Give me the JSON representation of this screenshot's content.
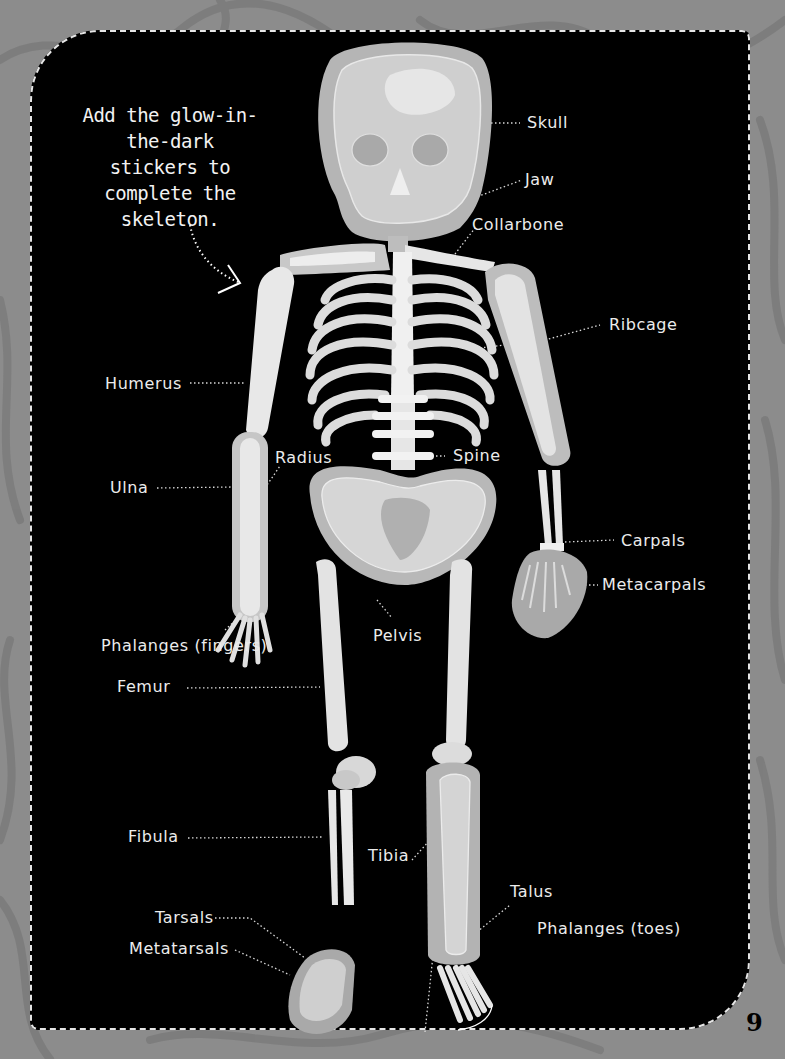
{
  "instruction": "Add the glow-in-the-dark stickers to complete the skeleton.",
  "page_number": "9",
  "colors": {
    "background": "#8c8c8c",
    "panel": "#000000",
    "bone_light": "#ebebeb",
    "bone_mid": "#c8c8c8",
    "bone_dark": "#a8a8a8",
    "label_text": "#ececec"
  },
  "labels": {
    "skull": "Skull",
    "jaw": "Jaw",
    "collarbone": "Collarbone",
    "ribcage": "Ribcage",
    "humerus": "Humerus",
    "radius": "Radius",
    "spine": "Spine",
    "ulna": "Ulna",
    "carpals": "Carpals",
    "metacarpals": "Metacarpals",
    "phalanges_fingers": "Phalanges (fingers)",
    "pelvis": "Pelvis",
    "femur": "Femur",
    "fibula": "Fibula",
    "tibia": "Tibia",
    "talus": "Talus",
    "tarsals": "Tarsals",
    "metatarsals": "Metatarsals",
    "phalanges_toes": "Phalanges (toes)"
  }
}
